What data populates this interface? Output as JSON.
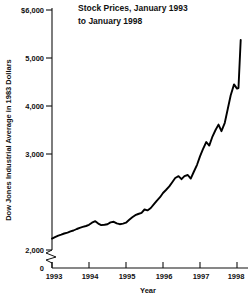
{
  "chart_data": {
    "type": "line",
    "title": "Stock Prices, January 1993 to January 1998",
    "title_line1": "Stock Prices, January 1993",
    "title_line2": "to January 1998",
    "xlabel": "Year",
    "ylabel": "Dow Jones Industrial Average in 1983 Dollars",
    "xlim": [
      1993.0,
      1998.15
    ],
    "ylim": [
      2000,
      6000
    ],
    "y_axis_break": true,
    "y_break_between": [
      0,
      2000
    ],
    "grid": false,
    "legend": null,
    "series_color": "#000000",
    "ytick_labels": [
      "$6,000",
      "5,000",
      "4,000",
      "3,000",
      "2,000",
      "0"
    ],
    "ytick_values": [
      6000,
      5000,
      4000,
      3000,
      2000,
      0
    ],
    "xtick_labels": [
      "1993",
      "1994",
      "1995",
      "1996",
      "1997",
      "1998"
    ],
    "xtick_values": [
      1993,
      1994,
      1995,
      1996,
      1997,
      1998
    ],
    "series": [
      {
        "name": "Dow Jones Industrial Average in 1983 Dollars",
        "x": [
          1993.0,
          1993.08,
          1993.17,
          1993.25,
          1993.33,
          1993.42,
          1993.5,
          1993.58,
          1993.67,
          1993.75,
          1993.83,
          1993.92,
          1994.0,
          1994.08,
          1994.17,
          1994.25,
          1994.33,
          1994.42,
          1994.5,
          1994.58,
          1994.67,
          1994.75,
          1994.83,
          1994.92,
          1995.0,
          1995.08,
          1995.17,
          1995.25,
          1995.33,
          1995.42,
          1995.5,
          1995.58,
          1995.67,
          1995.75,
          1995.83,
          1995.92,
          1996.0,
          1996.08,
          1996.17,
          1996.25,
          1996.33,
          1996.42,
          1996.5,
          1996.58,
          1996.67,
          1996.75,
          1996.83,
          1996.92,
          1997.0,
          1997.08,
          1997.17,
          1997.25,
          1997.33,
          1997.42,
          1997.5,
          1997.58,
          1997.67,
          1997.75,
          1997.83,
          1997.92,
          1998.0
        ],
        "values": [
          2190,
          2215,
          2240,
          2255,
          2275,
          2290,
          2310,
          2325,
          2350,
          2370,
          2385,
          2400,
          2420,
          2455,
          2480,
          2440,
          2415,
          2420,
          2430,
          2460,
          2470,
          2445,
          2430,
          2440,
          2455,
          2500,
          2545,
          2580,
          2600,
          2620,
          2675,
          2660,
          2700,
          2760,
          2820,
          2880,
          2950,
          3000,
          3060,
          3130,
          3200,
          3230,
          3180,
          3230,
          3250,
          3190,
          3300,
          3420,
          3560,
          3680,
          3800,
          3740,
          3880,
          4000,
          4090,
          3980,
          4120,
          4350,
          4580,
          4760,
          4690
        ]
      }
    ],
    "series_detail_note": "Monthly values rise from about 2,190 in January 1993 to a peak near 5,500 in January 1998, with dips in mid-1994, late 1996, mid-1997 and a sharp final rise.",
    "final_peak": 5500
  },
  "figure": {
    "background_color": "#ffffff",
    "cropped_text_top": ""
  }
}
